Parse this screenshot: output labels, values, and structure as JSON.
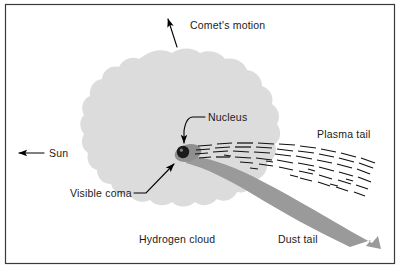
{
  "figure": {
    "width": 400,
    "height": 269,
    "background": "#ffffff",
    "frame_color": "#3a3a3a"
  },
  "colors": {
    "hydrogen_cloud": "#dcdcdc",
    "dust_tail": "#9a9a9a",
    "coma": "#8f8f8f",
    "nucleus": "#1a1a1a",
    "plasma_dash": "#111111",
    "text": "#1a1a1a",
    "arrow": "#000000"
  },
  "labels": {
    "comet_motion": "Comet's motion",
    "sun": "Sun",
    "nucleus": "Nucleus",
    "visible_coma": "Visible coma",
    "hydrogen_cloud": "Hydrogen cloud",
    "plasma_tail": "Plasma tail",
    "dust_tail": "Dust tail"
  },
  "annotations": {
    "comet_motion_arrow": "arrow pointing up",
    "sun_arrow": "arrow pointing left",
    "nucleus_leader": "leader line to nucleus",
    "coma_leader": "leader line to visible coma"
  },
  "diagram_parts": [
    "hydrogen-cloud",
    "visible-coma",
    "nucleus",
    "plasma-tail",
    "dust-tail"
  ]
}
